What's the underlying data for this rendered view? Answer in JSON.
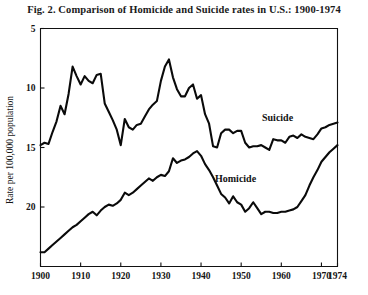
{
  "figure": {
    "title": "Fig. 2.  Comparison of Homicide and Suicide rates in U.S.: 1900-1974"
  },
  "axes": {
    "ylabel": "Rate per 100,000 population",
    "xlabel": "",
    "yticks": [
      "20",
      "15",
      "10",
      "5"
    ],
    "xticks": [
      "1900",
      "1910",
      "1920",
      "1930",
      "1940",
      "1950",
      "1960",
      "1970",
      "1974"
    ]
  },
  "labels": {
    "suicide": "Suicide",
    "homicide": "Homicide"
  },
  "colors": {
    "line": "#0a0a0a",
    "frame": "#111111",
    "background": "#ffffff"
  },
  "chart_data": {
    "type": "line",
    "title": "Fig. 2.  Comparison of Homicide and Suicide rates in U.S.: 1900-1974",
    "xlabel": "",
    "ylabel": "Rate per 100,000 population",
    "xlim": [
      1900,
      1974
    ],
    "ylim": [
      0,
      20
    ],
    "yticks": [
      5,
      10,
      15,
      20
    ],
    "xticks": [
      1900,
      1910,
      1920,
      1930,
      1940,
      1950,
      1960,
      1970,
      1974
    ],
    "grid": false,
    "legend": "inline-annotations",
    "annotations": [
      {
        "text": "Suicide",
        "x": 1957,
        "y": 13.2
      },
      {
        "text": "Homicide",
        "x": 1940,
        "y": 8.0
      }
    ],
    "x": [
      1900,
      1901,
      1902,
      1903,
      1904,
      1905,
      1906,
      1907,
      1908,
      1909,
      1910,
      1911,
      1912,
      1913,
      1914,
      1915,
      1916,
      1917,
      1918,
      1919,
      1920,
      1921,
      1922,
      1923,
      1924,
      1925,
      1926,
      1927,
      1928,
      1929,
      1930,
      1931,
      1932,
      1933,
      1934,
      1935,
      1936,
      1937,
      1938,
      1939,
      1940,
      1941,
      1942,
      1943,
      1944,
      1945,
      1946,
      1947,
      1948,
      1949,
      1950,
      1951,
      1952,
      1953,
      1954,
      1955,
      1956,
      1957,
      1958,
      1959,
      1960,
      1961,
      1962,
      1963,
      1964,
      1965,
      1966,
      1967,
      1968,
      1969,
      1970,
      1971,
      1972,
      1973,
      1974
    ],
    "series": [
      {
        "name": "Suicide",
        "values": [
          10.2,
          10.4,
          10.3,
          11.3,
          12.2,
          13.5,
          12.8,
          14.5,
          16.8,
          16.0,
          15.3,
          16.0,
          15.6,
          15.4,
          16.1,
          16.2,
          13.7,
          13.0,
          12.3,
          11.5,
          10.2,
          12.4,
          11.7,
          11.5,
          11.9,
          12.0,
          12.6,
          13.2,
          13.6,
          13.9,
          15.6,
          16.8,
          17.4,
          15.9,
          14.9,
          14.3,
          14.3,
          15.0,
          15.3,
          14.1,
          14.4,
          12.8,
          12.0,
          10.1,
          10.0,
          11.2,
          11.5,
          11.5,
          11.2,
          11.4,
          11.4,
          10.4,
          10.0,
          10.1,
          10.1,
          10.2,
          10.0,
          9.8,
          10.7,
          10.6,
          10.6,
          10.4,
          10.9,
          11.0,
          10.8,
          11.1,
          10.9,
          10.8,
          10.7,
          11.1,
          11.6,
          11.7,
          11.9,
          12.0,
          12.1
        ]
      },
      {
        "name": "Homicide",
        "values": [
          1.2,
          1.2,
          1.5,
          1.8,
          2.1,
          2.4,
          2.7,
          3.0,
          3.3,
          3.5,
          3.8,
          4.1,
          4.4,
          4.6,
          4.3,
          4.7,
          5.0,
          5.2,
          5.1,
          5.3,
          5.6,
          6.2,
          6.0,
          6.2,
          6.5,
          6.8,
          7.1,
          7.4,
          7.2,
          7.5,
          7.7,
          7.6,
          8.0,
          9.1,
          8.7,
          8.9,
          9.0,
          9.2,
          9.5,
          9.7,
          9.3,
          8.6,
          8.1,
          7.5,
          6.8,
          6.1,
          5.8,
          5.3,
          5.9,
          5.4,
          5.2,
          4.6,
          4.9,
          5.4,
          4.9,
          4.4,
          4.6,
          4.6,
          4.5,
          4.5,
          4.6,
          4.6,
          4.7,
          4.8,
          5.0,
          5.5,
          6.0,
          6.8,
          7.5,
          8.1,
          8.8,
          9.2,
          9.6,
          9.9,
          10.2
        ]
      }
    ]
  }
}
